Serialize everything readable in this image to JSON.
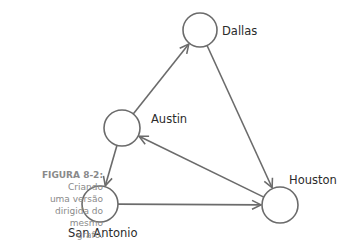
{
  "figure": {
    "caption_title": "FIGURA 8-2:",
    "caption_lines": [
      "Criando",
      "uma versão",
      "dirigida do",
      "mesmo",
      "grafo."
    ]
  },
  "graph": {
    "directed": true,
    "colors": {
      "stroke": "#6b6b6b",
      "label": "#2b2b2b",
      "caption": "#8a8a8a",
      "background": "#ffffff"
    },
    "nodes": [
      {
        "id": "dallas",
        "label": "Dallas",
        "cx": 200,
        "cy": 30,
        "r": 17,
        "label_x": 222,
        "label_y": 24
      },
      {
        "id": "austin",
        "label": "Austin",
        "cx": 122,
        "cy": 128,
        "r": 18,
        "label_x": 151,
        "label_y": 112
      },
      {
        "id": "san_antonio",
        "label": "San Antonio",
        "cx": 100,
        "cy": 204,
        "r": 18,
        "label_x": 68,
        "label_y": 226
      },
      {
        "id": "houston",
        "label": "Houston",
        "cx": 280,
        "cy": 205,
        "r": 18,
        "label_x": 289,
        "label_y": 173
      }
    ],
    "edges": [
      {
        "from": "austin",
        "to": "dallas"
      },
      {
        "from": "dallas",
        "to": "houston"
      },
      {
        "from": "houston",
        "to": "austin"
      },
      {
        "from": "austin",
        "to": "san_antonio"
      },
      {
        "from": "san_antonio",
        "to": "houston"
      }
    ]
  }
}
